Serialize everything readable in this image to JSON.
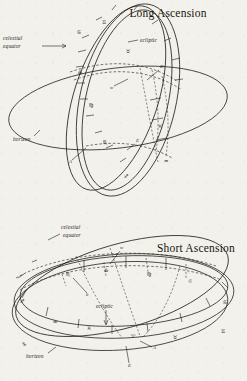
{
  "page": {
    "background_color": "#f3f1ec",
    "ink_color": "#1d1a15",
    "style": "scanned pen-and-ink astronomical diagram"
  },
  "figures": [
    {
      "id": "long-ascension",
      "title": "Long Ascension",
      "labels": {
        "celestial_equator": "celestial\nequator",
        "celestial_equator_line1": "celestial",
        "celestial_equator_line2": "equator",
        "ecliptic": "ecliptic",
        "horizon": "horizon",
        "point_d": "D",
        "point_w": "w",
        "point_a": "A",
        "point_e": "E"
      },
      "ecliptic_signs": [
        "♊",
        "♉",
        "♋",
        "♎",
        "♍",
        "♏",
        "♐"
      ],
      "equator_signs": [
        "♓",
        "♒"
      ],
      "sign_names": [
        "Gemini",
        "Taurus",
        "Cancer",
        "Libra",
        "Virgo",
        "Scorpio",
        "Sagittarius",
        "Pisces",
        "Aquarius"
      ]
    },
    {
      "id": "short-ascension",
      "title": "Short Ascension",
      "labels": {
        "celestial_equator_line1": "celestial",
        "celestial_equator_line2": "equator",
        "ecliptic": "ecliptic",
        "horizon": "horizon",
        "point_w": "w",
        "point_b": "b",
        "point_a": "A",
        "point_e": "E"
      },
      "ecliptic_signs": [
        "♑",
        "♒",
        "♓",
        "♈",
        "♉",
        "♊",
        "♐"
      ],
      "equator_signs": [
        "♏",
        "♎",
        "♍",
        "♌",
        "♋"
      ],
      "sign_names": [
        "Capricorn",
        "Aquarius",
        "Pisces",
        "Aries",
        "Taurus",
        "Gemini",
        "Sagittarius",
        "Scorpio",
        "Libra",
        "Virgo",
        "Leo",
        "Cancer"
      ]
    }
  ]
}
